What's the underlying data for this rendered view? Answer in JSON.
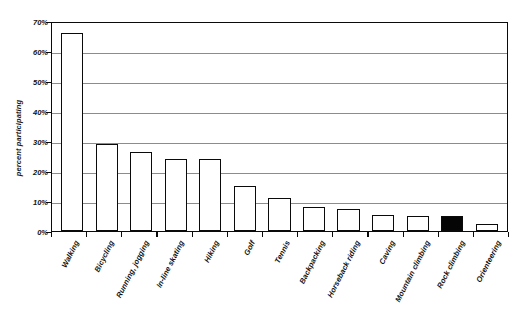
{
  "chart_data": {
    "type": "bar",
    "title": "",
    "subtitle": "",
    "xlabel": "",
    "ylabel": "percent participating",
    "ylim": [
      0,
      70
    ],
    "ytick_values": [
      0,
      10,
      20,
      30,
      40,
      50,
      60,
      70
    ],
    "ytick_labels": [
      "0%",
      "10%",
      "20%",
      "30%",
      "40%",
      "50%",
      "60%",
      "70%"
    ],
    "grid": true,
    "legend": "none",
    "value_unit": "percent",
    "highlight_category": "Rock climbing",
    "highlight_color": "#050505",
    "bar_fill_color": "#ffffff",
    "bar_edge_color": "#0a0a0a",
    "gridline_color": "#8c8c8c",
    "categories": [
      "Walking",
      "Bicycling",
      "Running, jogging",
      "In-line skating",
      "Hiking",
      "Golf",
      "Tennis",
      "Backpacking",
      "Horseback riding",
      "Caving",
      "Mountain climbing",
      "Rock climbing",
      "Orienteering"
    ],
    "values": [
      66,
      29,
      26.5,
      24,
      24,
      15,
      11,
      8,
      7.5,
      5.5,
      5,
      5,
      2.5
    ],
    "bars": [
      {
        "label": "Walking",
        "value": 66,
        "highlighted": false
      },
      {
        "label": "Bicycling",
        "value": 29,
        "highlighted": false
      },
      {
        "label": "Running, jogging",
        "value": 26.5,
        "highlighted": false
      },
      {
        "label": "In-line skating",
        "value": 24,
        "highlighted": false
      },
      {
        "label": "Hiking",
        "value": 24,
        "highlighted": false
      },
      {
        "label": "Golf",
        "value": 15,
        "highlighted": false
      },
      {
        "label": "Tennis",
        "value": 11,
        "highlighted": false
      },
      {
        "label": "Backpacking",
        "value": 8,
        "highlighted": false
      },
      {
        "label": "Horseback riding",
        "value": 7.5,
        "highlighted": false
      },
      {
        "label": "Caving",
        "value": 5.5,
        "highlighted": false
      },
      {
        "label": "Mountain climbing",
        "value": 5,
        "highlighted": false
      },
      {
        "label": "Rock climbing",
        "value": 5,
        "highlighted": true
      },
      {
        "label": "Orienteering",
        "value": 2.5,
        "highlighted": false
      }
    ]
  }
}
